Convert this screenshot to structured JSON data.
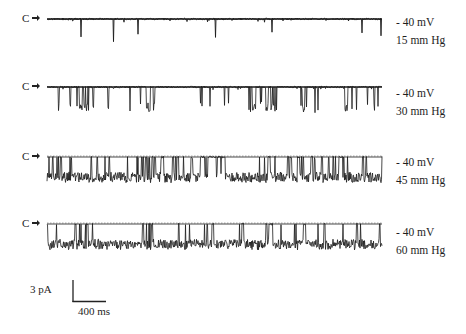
{
  "figure": {
    "closed_state_label": "C",
    "scale_bar": {
      "current_label": "3 pA",
      "time_label": "400 ms",
      "current_value_pA": 3,
      "time_value_ms": 400
    },
    "traces": [
      {
        "voltage_label": "- 40 mV",
        "pressure_label": "15 mm Hg",
        "activity": "sparse"
      },
      {
        "voltage_label": "- 40 mV",
        "pressure_label": "30 mm Hg",
        "activity": "moderate"
      },
      {
        "voltage_label": "- 40 mV",
        "pressure_label": "45 mm Hg",
        "activity": "high"
      },
      {
        "voltage_label": "- 40 mV",
        "pressure_label": "60 mm Hg",
        "activity": "very high"
      }
    ]
  },
  "chart_data": {
    "type": "line",
    "title": "",
    "xlabel": "time",
    "ylabel": "current",
    "closed_state_marker": "C",
    "scale_bar": {
      "current": "3 pA",
      "time": "400 ms"
    },
    "grid": false,
    "legend": "none",
    "series": [
      {
        "name": "15 mm Hg",
        "holding_potential": "-40 mV",
        "pressure_mmHg": 15,
        "open_probability_est": 0.05,
        "baseline_y_px": 19,
        "amplitude_px": 26,
        "x_range_px": [
          47,
          382
        ],
        "seed": 11,
        "burst_regions": []
      },
      {
        "name": "30 mm Hg",
        "holding_potential": "-40 mV",
        "pressure_mmHg": 30,
        "open_probability_est": 0.2,
        "baseline_y_px": 87,
        "amplitude_px": 24,
        "x_range_px": [
          47,
          382
        ],
        "seed": 23,
        "burst_regions": [
          [
            70,
            95
          ],
          [
            140,
            160
          ],
          [
            250,
            280
          ],
          [
            300,
            320
          ]
        ]
      },
      {
        "name": "45 mm Hg",
        "holding_potential": "-40 mV",
        "pressure_mmHg": 45,
        "open_probability_est": 0.5,
        "baseline_y_px": 157,
        "amplitude_px": 24,
        "x_range_px": [
          47,
          382
        ],
        "seed": 37,
        "burst_regions": [
          [
            47,
            200
          ],
          [
            225,
            382
          ]
        ]
      },
      {
        "name": "60 mm Hg",
        "holding_potential": "-40 mV",
        "pressure_mmHg": 60,
        "open_probability_est": 0.7,
        "baseline_y_px": 224,
        "amplitude_px": 24,
        "x_range_px": [
          47,
          382
        ],
        "seed": 53,
        "burst_regions": [
          [
            47,
            382
          ]
        ]
      }
    ]
  }
}
